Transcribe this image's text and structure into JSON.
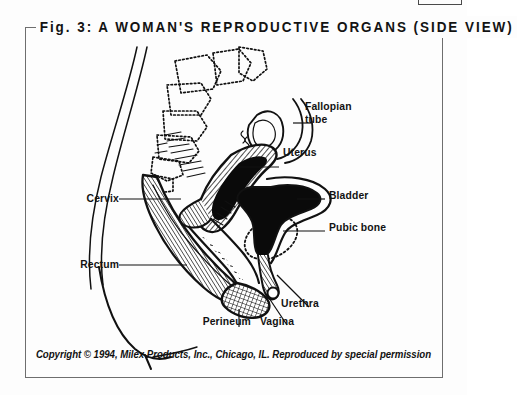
{
  "figure": {
    "title": "Fig. 3: A WOMAN'S REPRODUCTIVE ORGANS (SIDE VIEW)",
    "caption": "Copyright © 1994, Milex Products, Inc., Chicago, IL. Reproduced by special permission",
    "border_color": "#6e6e6e",
    "ink_color": "#111111",
    "background_color": "#fdfdfd"
  },
  "labels": {
    "fallopian_tube_line1": "Fallopian",
    "fallopian_tube_line2": "tube",
    "uterus": "Uterus",
    "bladder": "Bladder",
    "pubic_bone": "Pubic bone",
    "cervix": "Cervix",
    "rectum": "Rectum",
    "perineum": "Perineum",
    "vagina": "Vagina",
    "urethra": "Urethra"
  },
  "artwork": {
    "description": "Sagittal (side view) line drawing of the female pelvis and reproductive organs",
    "structures": [
      "abdominal-wall-outline",
      "sacrum-vertebrae-dotted",
      "coccyx-dotted",
      "pubic-bone-dotted-ellipse",
      "uterus-hatched",
      "uterine-cavity-solid-black",
      "fallopian-tube-and-ovary",
      "bladder-solid-black",
      "urethra-channel",
      "vaginal-canal",
      "cervix",
      "rectum-hatched",
      "perineum-crosshatched"
    ]
  }
}
